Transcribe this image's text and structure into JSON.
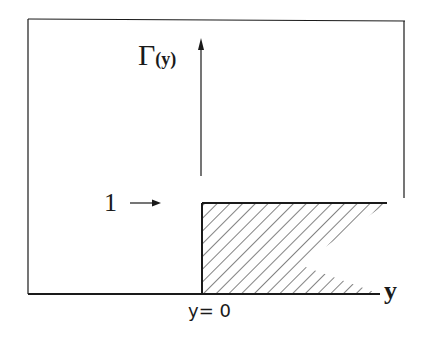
{
  "diagram": {
    "y_axis_label": "Γ",
    "y_axis_arg": "(y)",
    "level_label": "1",
    "level_arrow": "→",
    "x_axis_label": "y",
    "origin_label": "y= 0"
  },
  "colors": {
    "ink": "#1a1a1a",
    "background": "#ffffff"
  }
}
